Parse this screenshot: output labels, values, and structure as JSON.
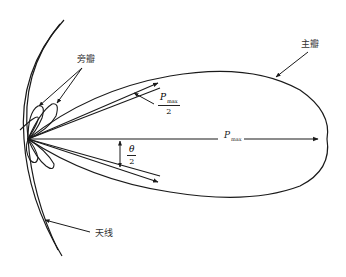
{
  "diagram": {
    "type": "antenna-radiation-pattern",
    "labels": {
      "side_lobe": "旁瓣",
      "main_lobe": "主瓣",
      "antenna": "天线",
      "p_max_symbol": "P",
      "p_max_subscript": "max",
      "half_power_numerator_symbol": "P",
      "half_power_numerator_subscript": "max",
      "half_power_denominator": "2",
      "theta_numerator": "θ",
      "theta_denominator": "2"
    },
    "colors": {
      "stroke": "#1a1a1a",
      "background": "#ffffff"
    }
  }
}
